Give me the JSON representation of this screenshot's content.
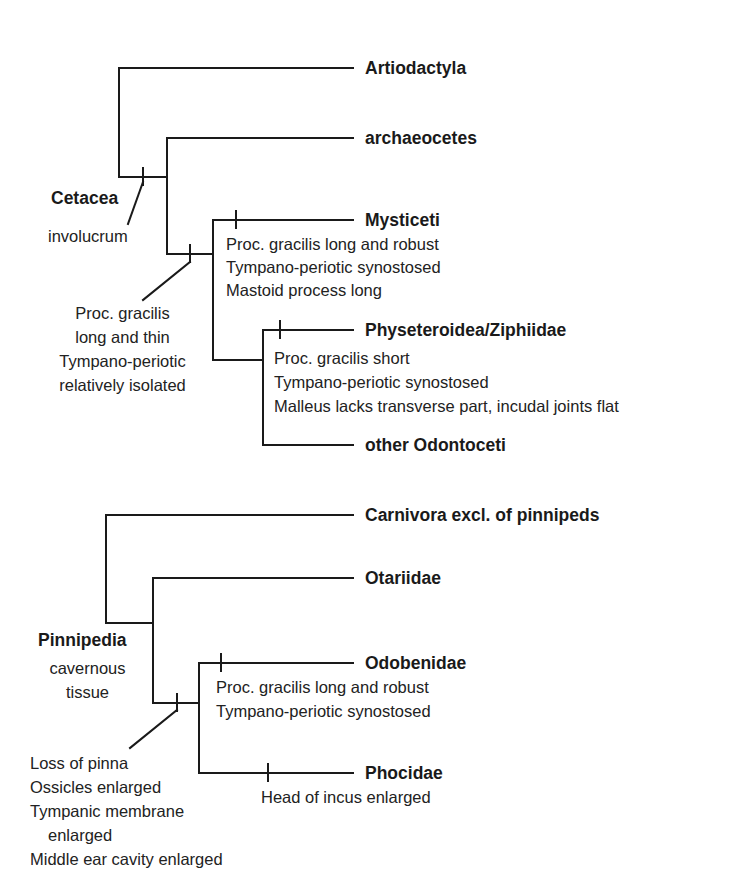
{
  "diagram_type": "cladogram",
  "trees": [
    {
      "group": "Cetacea",
      "taxa": [
        "Artiodactyla",
        "archaeocetes",
        "Mysticeti",
        "Physeteroidea/Ziphiidae",
        "other Odontoceti"
      ],
      "clade_label": "Cetacea",
      "clade_character": "involucrum",
      "node_characters": [
        "Proc. gracilis",
        "long and thin",
        "Tympano-periotic",
        "relatively isolated"
      ],
      "mysticeti_characters": [
        "Proc. gracilis long and robust",
        "Tympano-periotic synostosed",
        "Mastoid process long"
      ],
      "physeteroidea_characters": [
        "Proc. gracilis short",
        "Tympano-periotic synostosed",
        "Malleus lacks transverse part, incudal joints flat"
      ]
    },
    {
      "group": "Pinnipedia",
      "taxa": [
        "Carnivora excl. of pinnipeds",
        "Otariidae",
        "Odobenidae",
        "Phocidae"
      ],
      "clade_label": "Pinnipedia",
      "clade_character": [
        "cavernous",
        "tissue"
      ],
      "node_characters": [
        "Loss of pinna",
        "Ossicles enlarged",
        "Tympanic membrane",
        "enlarged",
        "Middle ear cavity enlarged"
      ],
      "odobenidae_characters": [
        "Proc. gracilis long and robust",
        "Tympano-periotic synostosed"
      ],
      "phocidae_characters": [
        "Head of incus enlarged"
      ]
    }
  ],
  "colors": {
    "line": "#1a1a1a",
    "text": "#1a1a1a",
    "background": "#ffffff"
  }
}
